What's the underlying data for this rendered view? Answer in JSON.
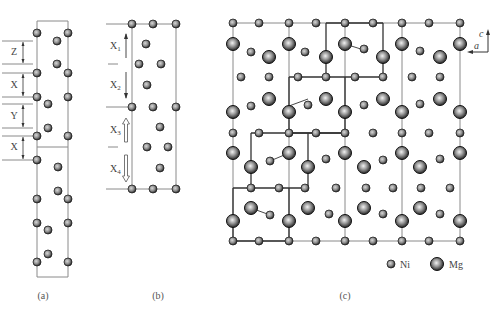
{
  "figure": {
    "panels": [
      {
        "id": "a",
        "caption": "(a)",
        "labels": [
          "Z",
          "X",
          "Y",
          "X"
        ],
        "box": {
          "x1": 37,
          "x2": 68,
          "y_top": 21,
          "y_mid": 147,
          "y_bottom": 277
        },
        "atoms_ni": [
          [
            37,
            33
          ],
          [
            68,
            33
          ],
          [
            57,
            41
          ],
          [
            57,
            64
          ],
          [
            37,
            73
          ],
          [
            68,
            73
          ],
          [
            37,
            97
          ],
          [
            68,
            97
          ],
          [
            48,
            104
          ],
          [
            48,
            128
          ],
          [
            37,
            136
          ],
          [
            68,
            136
          ],
          [
            37,
            160
          ],
          [
            58,
            167
          ],
          [
            58,
            191
          ],
          [
            37,
            199
          ],
          [
            68,
            199
          ],
          [
            37,
            223
          ],
          [
            68,
            223
          ],
          [
            48,
            230
          ],
          [
            48,
            254
          ],
          [
            37,
            262
          ],
          [
            68,
            262
          ]
        ],
        "dims": [
          {
            "label": "Z",
            "y1": 41,
            "y2": 64,
            "lx": 5,
            "ty": 55
          },
          {
            "label": "X",
            "y1": 73,
            "y2": 97,
            "lx": 5,
            "ty": 88
          },
          {
            "label": "Y",
            "y1": 104,
            "y2": 128,
            "lx": 5,
            "ty": 119
          },
          {
            "label": "X",
            "y1": 136,
            "y2": 160,
            "lx": 5,
            "ty": 150
          }
        ]
      },
      {
        "id": "b",
        "caption": "(b)",
        "labels": [
          "X1",
          "X2",
          "X3",
          "X4"
        ],
        "box": {
          "x1": 132,
          "x2": 176,
          "y_top": 24,
          "y_bottom": 189
        },
        "atoms_ni": [
          [
            132,
            24
          ],
          [
            153,
            24
          ],
          [
            176,
            24
          ],
          [
            146,
            44
          ],
          [
            139,
            64
          ],
          [
            161,
            64
          ],
          [
            147,
            85
          ],
          [
            132,
            107
          ],
          [
            153,
            107
          ],
          [
            176,
            107
          ],
          [
            160,
            127
          ],
          [
            147,
            147
          ],
          [
            168,
            147
          ],
          [
            160,
            168
          ],
          [
            132,
            189
          ],
          [
            153,
            189
          ],
          [
            176,
            189
          ]
        ],
        "arrows": [
          {
            "label": "X",
            "sub": "1",
            "dir": "up",
            "style": "solid",
            "y1": 34,
            "y2": 58
          },
          {
            "label": "X",
            "sub": "2",
            "dir": "down",
            "style": "solid",
            "y1": 72,
            "y2": 98
          },
          {
            "label": "X",
            "sub": "3",
            "dir": "up",
            "style": "hollow",
            "y1": 118,
            "y2": 142
          },
          {
            "label": "X",
            "sub": "4",
            "dir": "down",
            "style": "hollow",
            "y1": 155,
            "y2": 182
          }
        ]
      },
      {
        "id": "c",
        "caption": "(c)",
        "axes": {
          "vertical": "c",
          "horizontal": "a"
        },
        "legend": [
          {
            "label": "Ni",
            "type": "small"
          },
          {
            "label": "Mg",
            "type": "large"
          }
        ],
        "atoms_ni": [
          [
            233,
            23
          ],
          [
            259,
            23
          ],
          [
            289,
            23
          ],
          [
            316,
            23
          ],
          [
            345,
            23
          ],
          [
            373,
            23
          ],
          [
            402,
            23
          ],
          [
            429,
            23
          ],
          [
            460,
            23
          ],
          [
            251,
            52
          ],
          [
            305,
            52
          ],
          [
            364,
            49
          ],
          [
            420,
            51
          ],
          [
            241,
            77
          ],
          [
            269,
            77
          ],
          [
            298,
            77
          ],
          [
            326,
            77
          ],
          [
            355,
            77
          ],
          [
            383,
            77
          ],
          [
            412,
            77
          ],
          [
            440,
            77
          ],
          [
            251,
            106
          ],
          [
            308,
            105
          ],
          [
            364,
            105
          ],
          [
            420,
            104
          ],
          [
            233,
            133
          ],
          [
            259,
            133
          ],
          [
            289,
            133
          ],
          [
            316,
            133
          ],
          [
            345,
            133
          ],
          [
            373,
            133
          ],
          [
            402,
            133
          ],
          [
            429,
            133
          ],
          [
            460,
            133
          ],
          [
            270,
            161
          ],
          [
            326,
            159
          ],
          [
            383,
            160
          ],
          [
            440,
            159
          ],
          [
            251,
            188
          ],
          [
            279,
            188
          ],
          [
            305,
            188
          ],
          [
            336,
            188
          ],
          [
            366,
            188
          ],
          [
            393,
            188
          ],
          [
            421,
            188
          ],
          [
            450,
            188
          ],
          [
            270,
            215
          ],
          [
            329,
            214
          ],
          [
            383,
            214
          ],
          [
            440,
            214
          ],
          [
            233,
            241
          ],
          [
            259,
            241
          ],
          [
            289,
            241
          ],
          [
            316,
            241
          ],
          [
            345,
            241
          ],
          [
            373,
            241
          ],
          [
            402,
            241
          ],
          [
            429,
            241
          ],
          [
            460,
            241
          ]
        ],
        "atoms_mg": [
          [
            233,
            44
          ],
          [
            289,
            44
          ],
          [
            345,
            44
          ],
          [
            402,
            44
          ],
          [
            460,
            44
          ],
          [
            269,
            57
          ],
          [
            326,
            57
          ],
          [
            383,
            57
          ],
          [
            440,
            57
          ],
          [
            269,
            99
          ],
          [
            326,
            99
          ],
          [
            383,
            99
          ],
          [
            440,
            99
          ],
          [
            233,
            112
          ],
          [
            289,
            112
          ],
          [
            345,
            112
          ],
          [
            402,
            112
          ],
          [
            460,
            112
          ],
          [
            233,
            153
          ],
          [
            289,
            153
          ],
          [
            345,
            153
          ],
          [
            402,
            153
          ],
          [
            460,
            153
          ],
          [
            251,
            167
          ],
          [
            308,
            167
          ],
          [
            364,
            167
          ],
          [
            420,
            167
          ],
          [
            251,
            208
          ],
          [
            308,
            208
          ],
          [
            364,
            208
          ],
          [
            420,
            208
          ],
          [
            233,
            221
          ],
          [
            289,
            221
          ],
          [
            345,
            221
          ],
          [
            402,
            221
          ],
          [
            460,
            221
          ]
        ],
        "thin_verticals": [
          233,
          289,
          345,
          402,
          460
        ],
        "thin_horizontals": [
          23,
          241
        ],
        "bold_paths": [
          "M326,23 L326,77 M383,23 L383,77 M326,23 L383,23 M289,77 L383,77 M289,77 L289,133 M289,133 L345,133 L345,77",
          "M251,133 L251,188 M308,133 L308,188 M251,133 L345,133 M233,188 L308,188 M233,188 L233,241 L289,241 L289,188"
        ],
        "displacement_arrows": [
          [
            [
              345,
              44
            ],
            [
              364,
              50
            ]
          ],
          [
            [
              308,
              99
            ],
            [
              289,
              106
            ]
          ],
          [
            [
              289,
              153
            ],
            [
              270,
              161
            ]
          ],
          [
            [
              251,
              208
            ],
            [
              270,
              215
            ]
          ]
        ]
      }
    ]
  }
}
